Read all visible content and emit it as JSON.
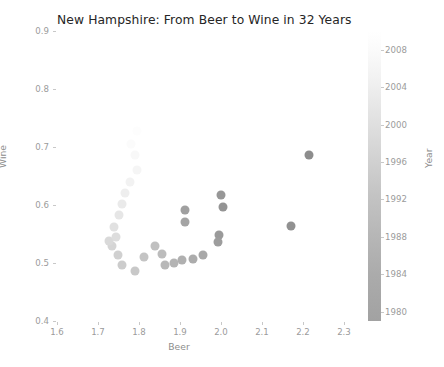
{
  "chart_data": {
    "type": "scatter",
    "title": "New Hampshire: From Beer to Wine in 32 Years",
    "xlabel": "Beer",
    "ylabel": "Wine",
    "xlim": [
      1.6,
      2.3
    ],
    "ylim": [
      0.4,
      0.9
    ],
    "xticks": [
      "1.6",
      "1.7",
      "1.8",
      "1.9",
      "2.0",
      "2.1",
      "2.2",
      "2.3"
    ],
    "xtick_values": [
      1.6,
      1.7,
      1.8,
      1.9,
      2.0,
      2.1,
      2.2,
      2.3
    ],
    "yticks": [
      "0.4",
      "0.5",
      "0.6",
      "0.7",
      "0.8",
      "0.9"
    ],
    "ytick_values": [
      0.4,
      0.5,
      0.6,
      0.7,
      0.8,
      0.9
    ],
    "grid": false,
    "legend": "none",
    "colorbar": {
      "label": "Year",
      "position": "right",
      "cmap": "greys_reversed",
      "vmin": 1979,
      "vmax": 2010,
      "ticks": [
        "1980",
        "1984",
        "1988",
        "1992",
        "1996",
        "2000",
        "2004",
        "2008"
      ],
      "tick_values": [
        1980,
        1984,
        1988,
        1992,
        1996,
        2000,
        2004,
        2008
      ],
      "low_color": "#a2a2a2",
      "high_color": "#ffffff"
    },
    "color_by": "Year",
    "marker": "circle",
    "marker_size_px": 9,
    "points": [
      {
        "year": 1980,
        "beer": 2.215,
        "wine": 0.686,
        "color": "#8d8d8d"
      },
      {
        "year": 1981,
        "beer": 2.17,
        "wine": 0.563,
        "color": "#919191"
      },
      {
        "year": 1982,
        "beer": 2.005,
        "wine": 0.596,
        "color": "#949494"
      },
      {
        "year": 1983,
        "beer": 2.0,
        "wine": 0.617,
        "color": "#979797"
      },
      {
        "year": 1984,
        "beer": 1.996,
        "wine": 0.548,
        "color": "#9a9a9a"
      },
      {
        "year": 1985,
        "beer": 1.993,
        "wine": 0.536,
        "color": "#9d9d9d"
      },
      {
        "year": 1986,
        "beer": 1.913,
        "wine": 0.592,
        "color": "#a0a0a0"
      },
      {
        "year": 1987,
        "beer": 1.911,
        "wine": 0.571,
        "color": "#a4a4a4"
      },
      {
        "year": 1988,
        "beer": 1.956,
        "wine": 0.513,
        "color": "#a8a8a8"
      },
      {
        "year": 1989,
        "beer": 1.931,
        "wine": 0.507,
        "color": "#acacac"
      },
      {
        "year": 1990,
        "beer": 1.906,
        "wine": 0.505,
        "color": "#b0b0b0"
      },
      {
        "year": 1991,
        "beer": 1.885,
        "wine": 0.5,
        "color": "#b4b4b4"
      },
      {
        "year": 1992,
        "beer": 1.863,
        "wine": 0.496,
        "color": "#b8b8b8"
      },
      {
        "year": 1993,
        "beer": 1.855,
        "wine": 0.515,
        "color": "#bcbcbc"
      },
      {
        "year": 1994,
        "beer": 1.838,
        "wine": 0.53,
        "color": "#c0c0c0"
      },
      {
        "year": 1995,
        "beer": 1.812,
        "wine": 0.51,
        "color": "#c4c4c4"
      },
      {
        "year": 1996,
        "beer": 1.79,
        "wine": 0.487,
        "color": "#c8c8c8"
      },
      {
        "year": 1997,
        "beer": 1.758,
        "wine": 0.497,
        "color": "#cccccc"
      },
      {
        "year": 1998,
        "beer": 1.748,
        "wine": 0.514,
        "color": "#d0d0d0"
      },
      {
        "year": 1999,
        "beer": 1.734,
        "wine": 0.529,
        "color": "#d5d5d5"
      },
      {
        "year": 2000,
        "beer": 1.728,
        "wine": 0.538,
        "color": "#d9d9d9"
      },
      {
        "year": 2001,
        "beer": 1.744,
        "wine": 0.544,
        "color": "#dddddd"
      },
      {
        "year": 2002,
        "beer": 1.739,
        "wine": 0.562,
        "color": "#e1e1e1"
      },
      {
        "year": 2003,
        "beer": 1.752,
        "wine": 0.583,
        "color": "#e6e6e6"
      },
      {
        "year": 2004,
        "beer": 1.758,
        "wine": 0.601,
        "color": "#eaeaea"
      },
      {
        "year": 2005,
        "beer": 1.766,
        "wine": 0.62,
        "color": "#eeeeee"
      },
      {
        "year": 2006,
        "beer": 1.779,
        "wine": 0.64,
        "color": "#f2f2f2"
      },
      {
        "year": 2007,
        "beer": 1.795,
        "wine": 0.661,
        "color": "#f5f5f5"
      },
      {
        "year": 2008,
        "beer": 1.79,
        "wine": 0.686,
        "color": "#f8f8f8"
      },
      {
        "year": 2009,
        "beer": 1.78,
        "wine": 0.705,
        "color": "#fbfbfb"
      },
      {
        "year": 2010,
        "beer": 1.796,
        "wine": 0.727,
        "color": "#fdfdfd"
      },
      {
        "year": 2011,
        "beer": 1.81,
        "wine": 0.745,
        "color": "#ffffff"
      }
    ]
  }
}
